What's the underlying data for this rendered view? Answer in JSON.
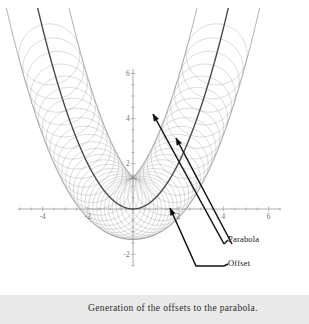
{
  "figure": {
    "caption": "Generation of the offsets to the parabola.",
    "background_color": "#ffffff",
    "caption_band_color": "#e9e9e9"
  },
  "annotations": [
    {
      "name": "parabola",
      "label": "Parabola"
    },
    {
      "name": "offset",
      "label": "Offset"
    }
  ],
  "axes": {
    "x_ticks": [
      {
        "value": -4,
        "label": "-4"
      },
      {
        "value": -2,
        "label": "-2"
      },
      {
        "value": 2,
        "label": "2"
      },
      {
        "value": 4,
        "label": "4"
      },
      {
        "value": 6,
        "label": "6"
      }
    ],
    "y_ticks": [
      {
        "value": 6,
        "label": "6"
      },
      {
        "value": 4,
        "label": "4"
      },
      {
        "value": 2,
        "label": "2"
      },
      {
        "value": -2,
        "label": "-2"
      }
    ],
    "x_range": [
      -5.2,
      6.6
    ],
    "y_range": [
      -2.6,
      6.4
    ],
    "minor_tick_step": 0.5,
    "axis_color": "#8a8a8a"
  },
  "chart_data": {
    "type": "line",
    "title": "Generation of the offsets to the parabola.",
    "xlabel": "",
    "ylabel": "",
    "xlim": [
      -5.2,
      6.6
    ],
    "ylim": [
      -2.6,
      6.4
    ],
    "grid": false,
    "legend": "none",
    "base_curve": {
      "name": "Parabola",
      "equation": "y = x^2 / 2",
      "color": "#4a4a4a",
      "line_width": 1.4,
      "x_domain": [
        -3.8,
        3.8
      ]
    },
    "offset_radius": 1.35,
    "generating_circles": {
      "name": "Circles of constant radius centered on the parabola",
      "count": 44,
      "radius": 1.35,
      "center_param_range": [
        -3.7,
        3.7
      ],
      "color": "#9a9a9a",
      "line_width": 0.35
    },
    "offset_curves": [
      {
        "name": "Outer offset",
        "description": "Parabola offset outward by radius 1.35",
        "side": "+1",
        "color": "#8c8c8c",
        "line_width": 0.7
      },
      {
        "name": "Inner offset",
        "description": "Parabola offset inward by radius 1.35; forms a cusp above the vertex",
        "side": "-1",
        "color": "#8c8c8c",
        "line_width": 0.7
      }
    ],
    "annotations": [
      {
        "text": "Parabola",
        "points_to": "base parabola curve",
        "arrow_count": 2
      },
      {
        "text": "Offset",
        "points_to": "offset curve",
        "arrow_count": 1
      }
    ]
  }
}
